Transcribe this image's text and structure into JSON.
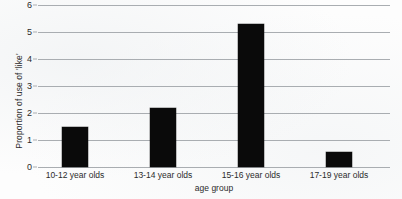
{
  "chart_data": {
    "type": "bar",
    "title": "",
    "subtitle": "",
    "categories": [
      "10-12 year olds",
      "13-14 year olds",
      "15-16 year olds",
      "17-19 year olds"
    ],
    "values": [
      1.5,
      2.2,
      5.3,
      0.55
    ],
    "series": [
      {
        "name": "Proportion of use of 'like'",
        "values": [
          1.5,
          2.2,
          5.3,
          0.55
        ]
      }
    ],
    "xlabel": "age group",
    "ylabel": "Proportion of use of 'like'",
    "ylim": [
      0,
      6
    ],
    "yticks": [
      0,
      1,
      2,
      3,
      4,
      5,
      6
    ],
    "ytick_labels": [
      "0",
      "1",
      "2",
      "3",
      "4",
      "5",
      "6"
    ],
    "grid": true,
    "grid_axis": "y",
    "legend": false,
    "legend_position": "none",
    "bar_color": "#0a0a0a",
    "gridline_color": "#a9adb1",
    "background_color": "#fdfdfd",
    "text_color": "#2b2b2b",
    "annotations": []
  }
}
